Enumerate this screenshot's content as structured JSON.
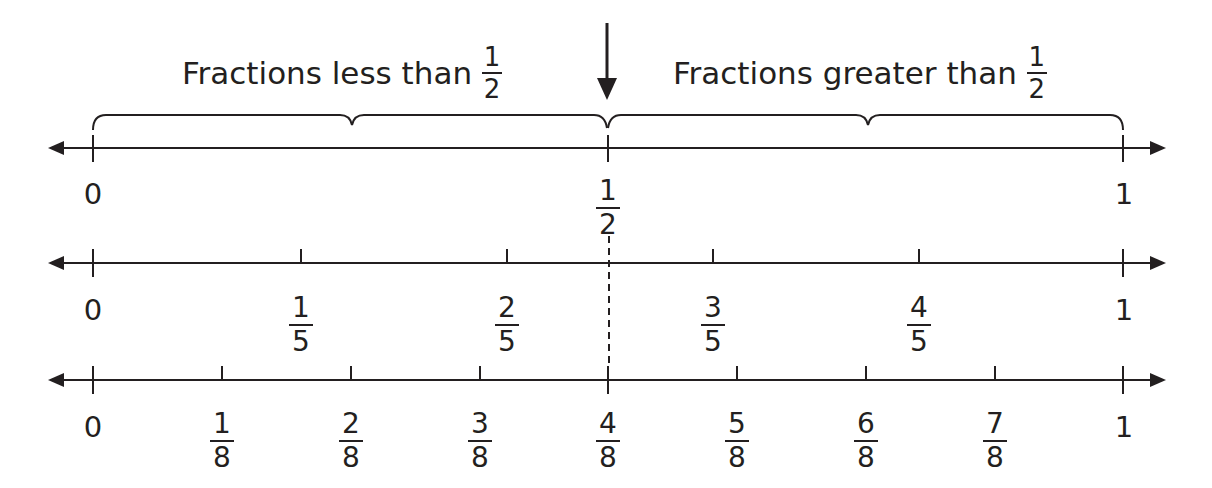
{
  "headings": {
    "left": {
      "text": "Fractions less than",
      "num": "1",
      "den": "2"
    },
    "right": {
      "text": "Fractions greater than",
      "num": "1",
      "den": "2"
    }
  },
  "lines": [
    {
      "name": "halves",
      "labels": [
        {
          "type": "whole",
          "value": "0"
        },
        {
          "type": "fraction",
          "num": "1",
          "den": "2"
        },
        {
          "type": "whole",
          "value": "1"
        }
      ]
    },
    {
      "name": "fifths",
      "labels": [
        {
          "type": "whole",
          "value": "0"
        },
        {
          "type": "fraction",
          "num": "1",
          "den": "5"
        },
        {
          "type": "fraction",
          "num": "2",
          "den": "5"
        },
        {
          "type": "fraction",
          "num": "3",
          "den": "5"
        },
        {
          "type": "fraction",
          "num": "4",
          "den": "5"
        },
        {
          "type": "whole",
          "value": "1"
        }
      ]
    },
    {
      "name": "eighths",
      "labels": [
        {
          "type": "whole",
          "value": "0"
        },
        {
          "type": "fraction",
          "num": "1",
          "den": "8"
        },
        {
          "type": "fraction",
          "num": "2",
          "den": "8"
        },
        {
          "type": "fraction",
          "num": "3",
          "den": "8"
        },
        {
          "type": "fraction",
          "num": "4",
          "den": "8"
        },
        {
          "type": "fraction",
          "num": "5",
          "den": "8"
        },
        {
          "type": "fraction",
          "num": "6",
          "den": "8"
        },
        {
          "type": "fraction",
          "num": "7",
          "den": "8"
        },
        {
          "type": "whole",
          "value": "1"
        }
      ]
    }
  ],
  "colors": {
    "ink": "#231f20",
    "background": "#ffffff"
  }
}
